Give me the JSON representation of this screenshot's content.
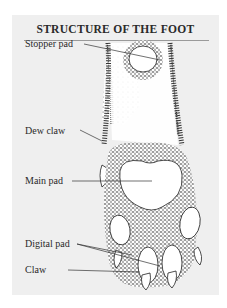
{
  "title": "STRUCTURE OF THE FOOT",
  "labels": {
    "stopper_pad": "Stopper pad",
    "dew_claw": "Dew claw",
    "main_pad": "Main pad",
    "digital_pad": "Digital pad",
    "claw": "Claw"
  },
  "colors": {
    "frame_bg": "#efefef",
    "ink": "#2a2a2a",
    "pad_fill": "#ffffff"
  }
}
